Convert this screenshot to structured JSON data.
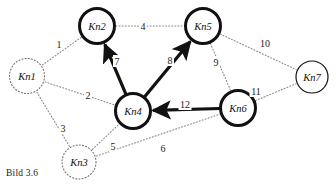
{
  "figure": {
    "caption": "Bild 3.6",
    "clipped_header_text": "",
    "background_color": "#ffffff",
    "ink_color": "#111111",
    "dotted_edge_color": "#8c8c8c"
  },
  "nodes": [
    {
      "id": "Kn1",
      "label": "Kn1",
      "cx": 27,
      "cy": 76,
      "r": 17.5,
      "style": "dotted",
      "stroke_width": 1.1
    },
    {
      "id": "Kn2",
      "label": "Kn2",
      "cx": 97,
      "cy": 26,
      "r": 17.5,
      "style": "bold-solid",
      "stroke_width": 3.0
    },
    {
      "id": "Kn3",
      "label": "Kn3",
      "cx": 79,
      "cy": 162,
      "r": 17.0,
      "style": "dotted",
      "stroke_width": 1.1
    },
    {
      "id": "Kn4",
      "label": "Kn4",
      "cx": 133,
      "cy": 111,
      "r": 17.5,
      "style": "bold-solid",
      "stroke_width": 3.0
    },
    {
      "id": "Kn5",
      "label": "Kn5",
      "cx": 203,
      "cy": 26,
      "r": 17.5,
      "style": "bold-solid",
      "stroke_width": 3.0
    },
    {
      "id": "Kn6",
      "label": "Kn6",
      "cx": 238,
      "cy": 108,
      "r": 17.5,
      "style": "bold-solid",
      "stroke_width": 3.0
    },
    {
      "id": "Kn7",
      "label": "Kn7",
      "cx": 312,
      "cy": 77,
      "r": 16.0,
      "style": "thin-solid",
      "stroke_width": 1.2
    }
  ],
  "edges": [
    {
      "id": "e1",
      "label": "1",
      "from": "Kn1",
      "to": "Kn2",
      "style": "dotted",
      "directed": false,
      "label_x": 59,
      "label_y": 44
    },
    {
      "id": "e2",
      "label": "2",
      "from": "Kn1",
      "to": "Kn4",
      "style": "dotted",
      "directed": false,
      "label_x": 88,
      "label_y": 95
    },
    {
      "id": "e3",
      "label": "3",
      "from": "Kn1",
      "to": "Kn3",
      "style": "dotted",
      "directed": false,
      "label_x": 63,
      "label_y": 128
    },
    {
      "id": "e4",
      "label": "4",
      "from": "Kn2",
      "to": "Kn5",
      "style": "dotted",
      "directed": false,
      "label_x": 143,
      "label_y": 26
    },
    {
      "id": "e5",
      "label": "5",
      "from": "Kn3",
      "to": "Kn4",
      "style": "dotted",
      "directed": false,
      "label_x": 113,
      "label_y": 146
    },
    {
      "id": "e6",
      "label": "6",
      "from": "Kn3",
      "to": "Kn6",
      "style": "dotted",
      "directed": false,
      "label_x": 163,
      "label_y": 148
    },
    {
      "id": "e7",
      "label": "7",
      "from": "Kn4",
      "to": "Kn2",
      "style": "bold",
      "directed": true,
      "label_x": 117,
      "label_y": 61
    },
    {
      "id": "e8",
      "label": "8",
      "from": "Kn4",
      "to": "Kn5",
      "style": "bold",
      "directed": true,
      "label_x": 170,
      "label_y": 60
    },
    {
      "id": "e9",
      "label": "9",
      "from": "Kn5",
      "to": "Kn6",
      "style": "dotted",
      "directed": false,
      "label_x": 216,
      "label_y": 62
    },
    {
      "id": "e10",
      "label": "10",
      "from": "Kn5",
      "to": "Kn7",
      "style": "dotted",
      "directed": false,
      "label_x": 265,
      "label_y": 43
    },
    {
      "id": "e11",
      "label": "11",
      "from": "Kn6",
      "to": "Kn7",
      "style": "dotted",
      "directed": false,
      "label_x": 256,
      "label_y": 91
    },
    {
      "id": "e12",
      "label": "12",
      "from": "Kn6",
      "to": "Kn4",
      "style": "bold",
      "directed": true,
      "label_x": 185,
      "label_y": 104
    }
  ]
}
